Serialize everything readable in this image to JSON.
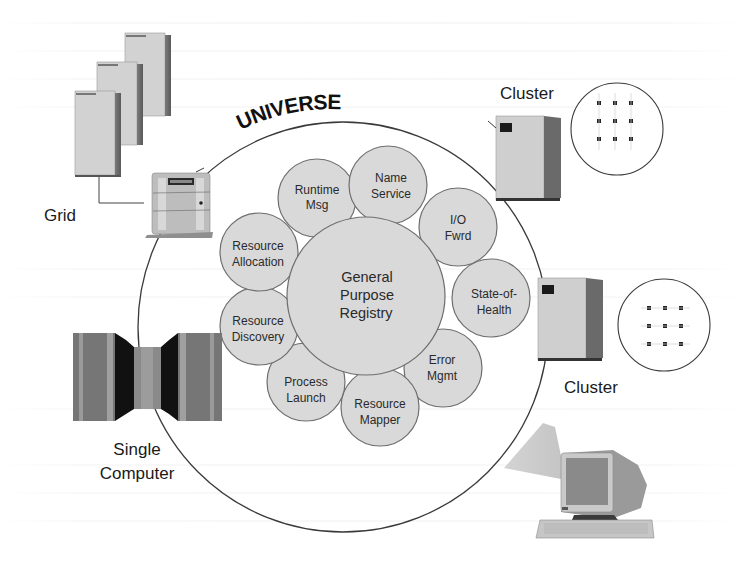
{
  "diagram": {
    "title": "UNIVERSE",
    "center": {
      "lines": [
        "General",
        "Purpose",
        "Registry"
      ]
    },
    "services": [
      {
        "id": "runtime-msg",
        "lines": [
          "Runtime",
          "Msg"
        ]
      },
      {
        "id": "name-service",
        "lines": [
          "Name",
          "Service"
        ]
      },
      {
        "id": "io-fwrd",
        "lines": [
          "I/O",
          "Fwrd"
        ]
      },
      {
        "id": "state-of-health",
        "lines": [
          "State-of-",
          "Health"
        ]
      },
      {
        "id": "error-mgmt",
        "lines": [
          "Error",
          "Mgmt"
        ]
      },
      {
        "id": "resource-mapper",
        "lines": [
          "Resource",
          "Mapper"
        ]
      },
      {
        "id": "process-launch",
        "lines": [
          "Process",
          "Launch"
        ]
      },
      {
        "id": "resource-discovery",
        "lines": [
          "Resource",
          "Discovery"
        ]
      },
      {
        "id": "resource-allocation",
        "lines": [
          "Resource",
          "Allocation"
        ]
      }
    ],
    "nodes": {
      "grid": {
        "label": "Grid"
      },
      "cluster_top": {
        "label": "Cluster"
      },
      "cluster_bottom": {
        "label": "Cluster"
      },
      "single_computer": {
        "label_line1": "Single",
        "label_line2": "Computer"
      }
    },
    "colors": {
      "bubble_fill": "#d9d9d9",
      "bubble_stroke": "#6e6e6e",
      "ring_stroke": "#3a3a3a",
      "text": "#1a1a1a"
    }
  }
}
